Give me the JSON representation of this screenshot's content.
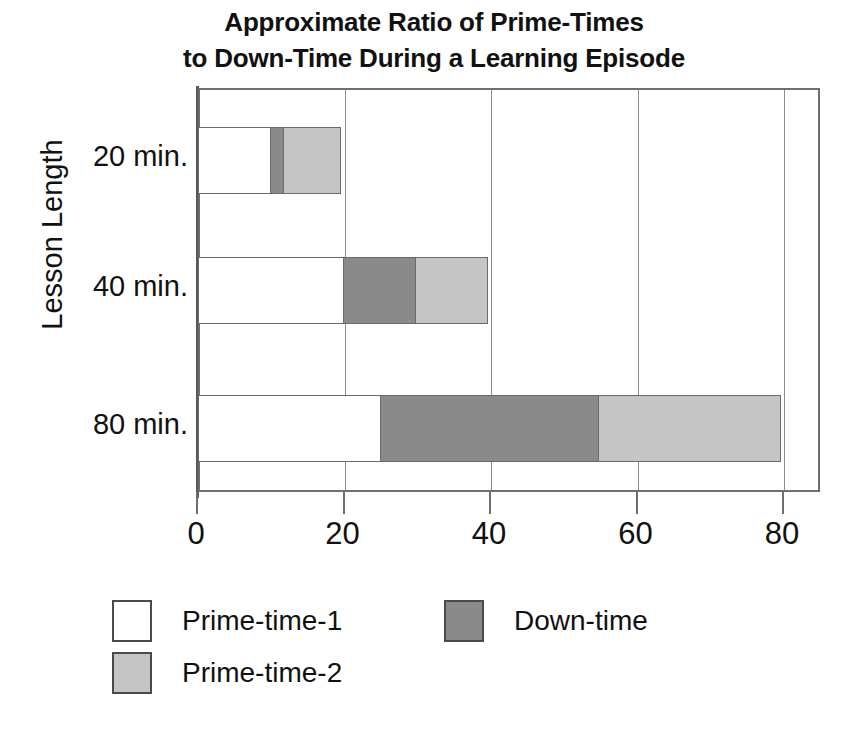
{
  "title": {
    "line1": "Approximate Ratio of Prime-Times",
    "line2": "to Down-Time During a Learning Episode"
  },
  "axes": {
    "y_title": "Lesson Length",
    "x_ticks": [
      "0",
      "20",
      "40",
      "60",
      "80"
    ]
  },
  "legend": {
    "items": [
      {
        "label": "Prime-time-1",
        "color": "#ffffff"
      },
      {
        "label": "Prime-time-2",
        "color": "#c5c5c5"
      },
      {
        "label": "Down-time",
        "color": "#8a8a8a"
      }
    ]
  },
  "colors": {
    "prime_time_1": "#ffffff",
    "prime_time_2": "#c5c5c5",
    "down_time": "#8a8a8a",
    "frame": "#6f6f6f",
    "text": "#111111"
  },
  "chart_data": {
    "type": "bar",
    "orientation": "horizontal",
    "stacked": true,
    "title": "Approximate Ratio of Prime-Times to Down-Time During a Learning Episode",
    "xlabel": "",
    "ylabel": "Lesson Length",
    "categories": [
      "20 min.",
      "40 min.",
      "80 min."
    ],
    "xlim": [
      0,
      80
    ],
    "xticks": [
      0,
      20,
      40,
      60,
      80
    ],
    "grid": "vertical",
    "legend_position": "bottom-left",
    "series": [
      {
        "name": "Prime-time-1",
        "color": "#ffffff",
        "values": [
          10,
          20,
          25
        ]
      },
      {
        "name": "Down-time",
        "color": "#8a8a8a",
        "values": [
          2,
          10,
          30
        ]
      },
      {
        "name": "Prime-time-2",
        "color": "#c5c5c5",
        "values": [
          8,
          10,
          25
        ]
      }
    ],
    "cumulative_ends": [
      {
        "category": "20 min.",
        "ends": [
          10,
          12,
          20
        ]
      },
      {
        "category": "40 min.",
        "ends": [
          20,
          30,
          40
        ]
      },
      {
        "category": "80 min.",
        "ends": [
          25,
          55,
          80
        ]
      }
    ],
    "totals": [
      20,
      40,
      80
    ]
  }
}
